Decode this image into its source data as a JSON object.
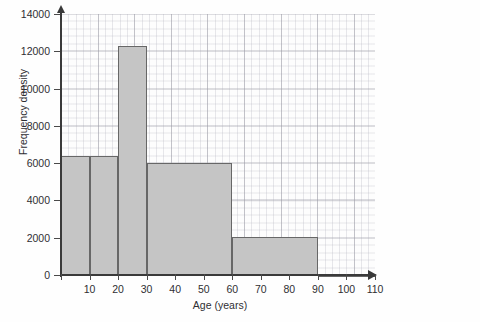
{
  "caption_cut": "",
  "chart_data": {
    "type": "bar",
    "title": "",
    "xlabel": "Age (years)",
    "ylabel": "Frequency density",
    "xlim": [
      0,
      110
    ],
    "ylim": [
      0,
      14000
    ],
    "grid": true,
    "legend": "none",
    "x_ticks": [
      "0",
      "10",
      "20",
      "30",
      "40",
      "50",
      "60",
      "70",
      "80",
      "90",
      "100",
      "110"
    ],
    "x_tick_values": [
      0,
      10,
      20,
      30,
      40,
      50,
      60,
      70,
      80,
      90,
      100,
      110
    ],
    "x_tick_labels_shown": [
      "",
      "10",
      "20",
      "30",
      "40",
      "50",
      "60",
      "70",
      "80",
      "90",
      "100",
      "110"
    ],
    "y_ticks": [
      "0",
      "2000",
      "4000",
      "6000",
      "8000",
      "10000",
      "12000",
      "14000"
    ],
    "y_tick_values": [
      0,
      2000,
      4000,
      6000,
      8000,
      10000,
      12000,
      14000
    ],
    "bars": [
      {
        "label": "0-10",
        "x0": 0,
        "x1": 10,
        "value": 6400
      },
      {
        "label": "10-20",
        "x0": 10,
        "x1": 20,
        "value": 6400
      },
      {
        "label": "20-30",
        "x0": 20,
        "x1": 30,
        "value": 12300
      },
      {
        "label": "30-60",
        "x0": 30,
        "x1": 60,
        "value": 6000
      },
      {
        "label": "60-90",
        "x0": 60,
        "x1": 90,
        "value": 2050
      },
      {
        "label": "90-110",
        "x0": 90,
        "x1": 110,
        "value": 0
      }
    ],
    "colors": {
      "bar_fill": "#c5c5c5",
      "bar_edge": "#676767",
      "axis": "#3a3a3a",
      "grid_minor": "#b2b2be",
      "grid_major": "#9696a0",
      "text": "#2f2f33",
      "background": "#fefefe"
    }
  }
}
